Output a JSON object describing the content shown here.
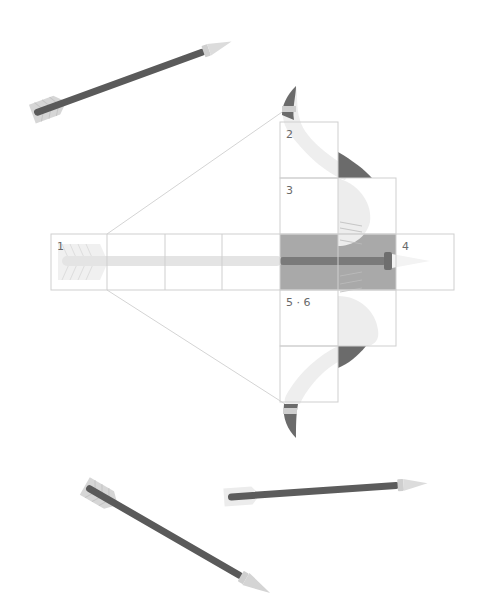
{
  "diagram": {
    "type": "crossbow-assembly-layout",
    "colors": {
      "background": "#ffffff",
      "grid_line": "#cfcfcf",
      "shaded_cell": "#a9a9a9",
      "shaft_dark": "#5a5a5a",
      "limb_dark": "#6b6b6b",
      "limb_light": "#eeeeee",
      "arrow_tip": "#d9d9d9",
      "fletching": "#d2d2d2",
      "guide_line": "#d4d4d4"
    },
    "cell_labels": [
      {
        "id": "1",
        "text": "1"
      },
      {
        "id": "2",
        "text": "2"
      },
      {
        "id": "3",
        "text": "3"
      },
      {
        "id": "4",
        "text": "4"
      },
      {
        "id": "5-6",
        "text": "5 · 6"
      }
    ],
    "arrows": [
      {
        "name": "arrow-top-left",
        "description": "arrow pointing up-right"
      },
      {
        "name": "arrow-bottom-left",
        "description": "arrow pointing down-right"
      },
      {
        "name": "arrow-bottom-right",
        "description": "arrow pointing right"
      }
    ]
  }
}
